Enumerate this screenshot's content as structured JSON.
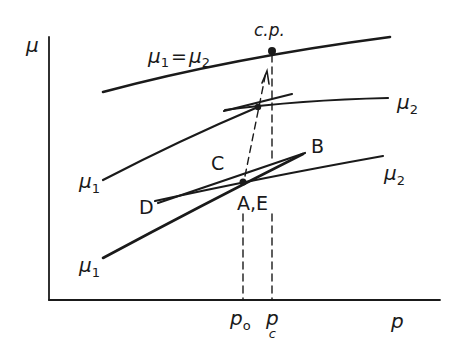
{
  "diagram": {
    "axes": {
      "y_label": "μ",
      "x_label": "p"
    },
    "curves": {
      "coexistence": {
        "label_mu1": "μ",
        "label_sub1": "1",
        "label_eq": "=",
        "label_mu2": "μ",
        "label_sub2": "2"
      },
      "upper_mu2": {
        "symbol": "μ",
        "sub": "2"
      },
      "upper_mu1": {
        "symbol": "μ",
        "sub": "1"
      },
      "lower_mu2": {
        "symbol": "μ",
        "sub": "2"
      },
      "lower_mu1": {
        "symbol": "μ",
        "sub": "1"
      }
    },
    "points": {
      "critical_point": "c.p.",
      "A_E": "A,E",
      "B": "B",
      "C": "C",
      "D": "D"
    },
    "x_ticks": {
      "p0_main": "p",
      "p0_sub": "o",
      "pc_main": "p",
      "pc_sub": "c"
    }
  }
}
